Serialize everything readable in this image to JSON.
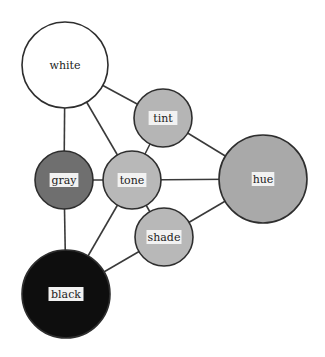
{
  "diagram": {
    "nodes": [
      {
        "id": "white",
        "label": "white",
        "cx": 65,
        "cy": 65,
        "r": 43,
        "fill": "#ffffff",
        "label_box": false
      },
      {
        "id": "tint",
        "label": "tint",
        "cx": 163,
        "cy": 118,
        "r": 29,
        "fill": "#b5b5b5",
        "label_box": true
      },
      {
        "id": "gray",
        "label": "gray",
        "cx": 64,
        "cy": 180,
        "r": 29,
        "fill": "#6f6f6f",
        "label_box": true
      },
      {
        "id": "tone",
        "label": "tone",
        "cx": 132,
        "cy": 180,
        "r": 29,
        "fill": "#b8b8b8",
        "label_box": true
      },
      {
        "id": "hue",
        "label": "hue",
        "cx": 263,
        "cy": 179,
        "r": 44,
        "fill": "#a9a9a9",
        "label_box": true
      },
      {
        "id": "shade",
        "label": "shade",
        "cx": 164,
        "cy": 237,
        "r": 29,
        "fill": "#b8b8b8",
        "label_box": true
      },
      {
        "id": "black",
        "label": "black",
        "cx": 66,
        "cy": 294,
        "r": 44,
        "fill": "#0e0e0e",
        "label_box": true
      }
    ],
    "edges": [
      [
        "white",
        "tint"
      ],
      [
        "white",
        "gray"
      ],
      [
        "white",
        "tone"
      ],
      [
        "tint",
        "tone"
      ],
      [
        "tint",
        "hue"
      ],
      [
        "gray",
        "tone"
      ],
      [
        "gray",
        "black"
      ],
      [
        "tone",
        "hue"
      ],
      [
        "tone",
        "shade"
      ],
      [
        "tone",
        "black"
      ],
      [
        "shade",
        "hue"
      ],
      [
        "shade",
        "black"
      ]
    ]
  }
}
